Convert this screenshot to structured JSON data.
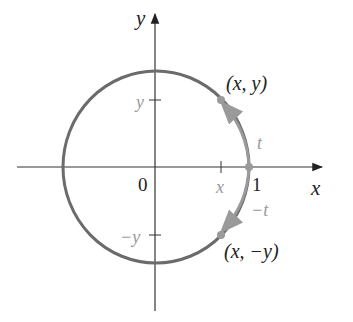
{
  "diagram": {
    "axes": {
      "x_label": "x",
      "y_label": "y",
      "origin_label": "0",
      "one_label": "1"
    },
    "ticks": {
      "x_tick": "x",
      "y_tick": "y",
      "neg_y_tick": "−y"
    },
    "points": {
      "upper": "(x, y)",
      "lower": "(x, −y)"
    },
    "arcs": {
      "upper": "t",
      "lower": "−t"
    },
    "colors": {
      "axis": "#333333",
      "circle": "#6b6b6b",
      "highlight": "#9a9a9a",
      "text": "#222222",
      "muted_text": "#9a9a9a"
    }
  }
}
